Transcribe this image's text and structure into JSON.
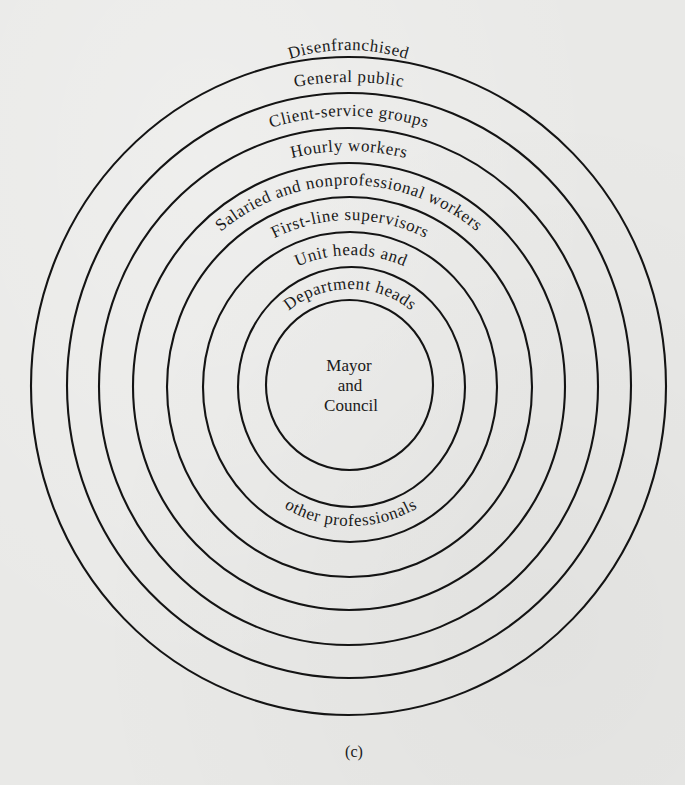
{
  "figure": {
    "caption": "(c)",
    "center": {
      "lines": [
        "Mayor",
        "and",
        "Council"
      ]
    },
    "rings": [
      {
        "index": 1,
        "label": "Disenfranchised",
        "position": "outside-top"
      },
      {
        "index": 2,
        "label": "General public",
        "position": "top"
      },
      {
        "index": 3,
        "label": "Client-service groups",
        "position": "top"
      },
      {
        "index": 4,
        "label": "Hourly workers",
        "position": "top"
      },
      {
        "index": 5,
        "label": "Salaried and nonprofessional workers",
        "position": "top"
      },
      {
        "index": 6,
        "label": "First-line supervisors",
        "position": "top"
      },
      {
        "index": 7,
        "label": "Unit heads and",
        "position": "top",
        "continuation": "other professionals"
      },
      {
        "index": 8,
        "label": "Department heads",
        "position": "top"
      }
    ],
    "bottom_label": "other professionals",
    "colors": {
      "background": "#e9e9e7",
      "ink": "#141414"
    }
  }
}
